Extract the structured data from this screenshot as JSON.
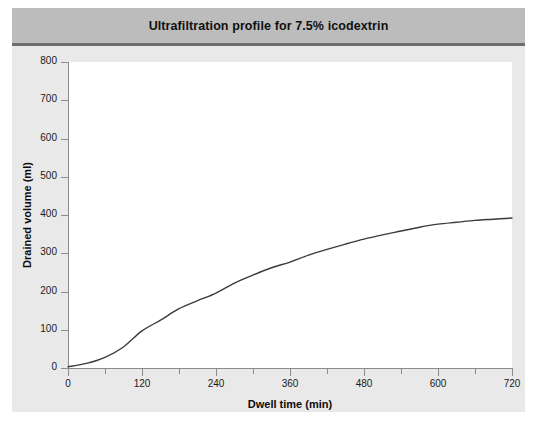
{
  "figure": {
    "title": "Ultrafiltration profile for 7.5% icodextrin",
    "background_color": "#e9e9e9",
    "title_bar_color": "#bcbcbc",
    "plot_background_color": "#ffffff",
    "curve_color": "#3b3b3b",
    "axis_color": "#8c8c8c"
  },
  "chart_data": {
    "type": "line",
    "title": "Ultrafiltration profile for 7.5% icodextrin",
    "xlabel": "Dwell time (min)",
    "ylabel": "Drained volume (ml)",
    "xlim": [
      0,
      720
    ],
    "ylim": [
      0,
      800
    ],
    "xticks": [
      0,
      120,
      240,
      360,
      480,
      600,
      720
    ],
    "xtick_labels": [
      "0",
      "120",
      "240",
      "360",
      "480",
      "600",
      "720"
    ],
    "x_minor_ticks": [
      60,
      180,
      300,
      420,
      540,
      660
    ],
    "yticks": [
      0,
      100,
      200,
      300,
      400,
      500,
      600,
      700,
      800
    ],
    "ytick_labels": [
      "0",
      "100",
      "200",
      "300",
      "400",
      "500",
      "600",
      "700",
      "800"
    ],
    "grid": false,
    "legend": null,
    "series": [
      {
        "name": "7.5% icodextrin",
        "x": [
          0,
          30,
          60,
          90,
          120,
          150,
          180,
          210,
          240,
          270,
          300,
          330,
          360,
          390,
          420,
          450,
          480,
          510,
          540,
          570,
          600,
          630,
          660,
          690,
          720
        ],
        "values": [
          3,
          12,
          28,
          55,
          97,
          125,
          155,
          176,
          196,
          222,
          243,
          262,
          277,
          295,
          310,
          324,
          337,
          348,
          358,
          368,
          376,
          381,
          386,
          389,
          392
        ]
      }
    ]
  },
  "labels": {
    "xaxis": "Dwell time (min)",
    "yaxis": "Drained volume (ml)"
  }
}
